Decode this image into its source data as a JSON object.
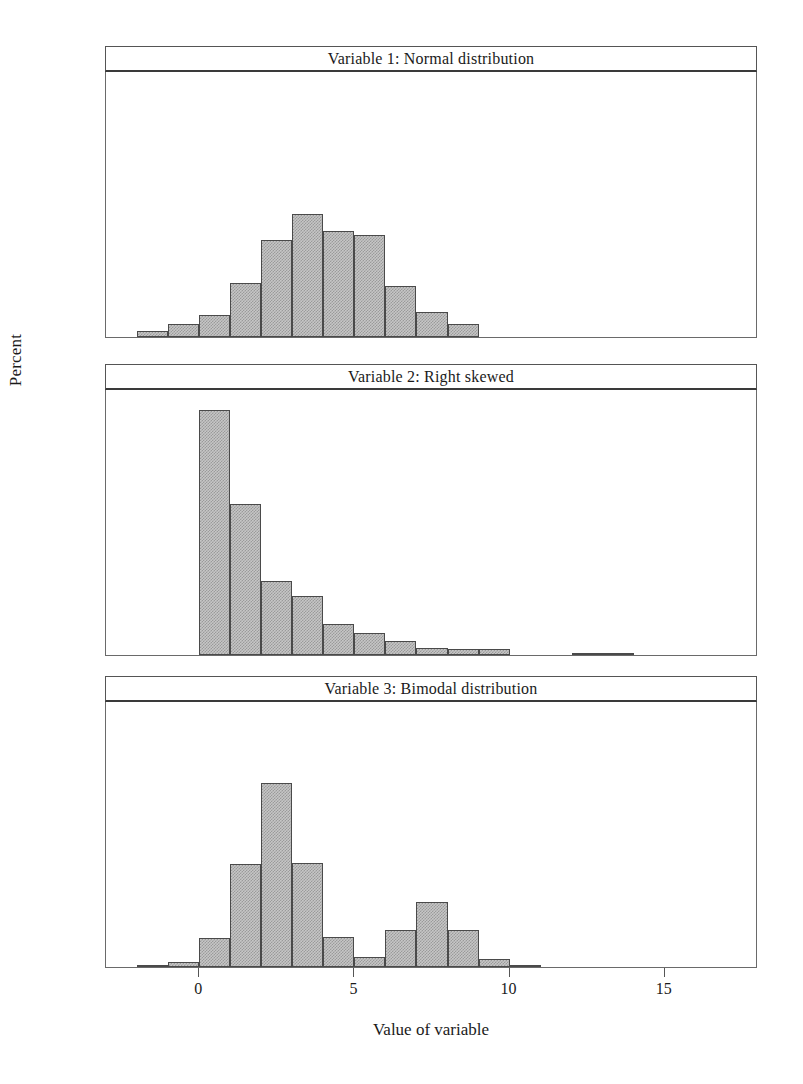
{
  "axes": {
    "ylabel": "Percent",
    "xlabel": "Value of variable",
    "yticks": [
      0,
      10,
      20,
      30,
      40
    ],
    "xticks": [
      0,
      5,
      10,
      15
    ],
    "ylim": [
      0,
      44
    ],
    "xlim": [
      -3,
      18
    ]
  },
  "colors": {
    "bar_fill": "#c6c6c6",
    "bar_edge": "#4a4a4a",
    "axis": "#6a6a6a",
    "text": "#1a1a1a"
  },
  "chart_data": [
    {
      "type": "bar",
      "title": "Variable 1: Normal distribution",
      "xlabel": "Value of variable",
      "ylabel": "Percent",
      "xlim": [
        -3,
        18
      ],
      "ylim": [
        0,
        44
      ],
      "bin_width": 1,
      "bin_starts": [
        -2,
        -1,
        0,
        1,
        2,
        3,
        4,
        5,
        6,
        7,
        8
      ],
      "values": [
        1.0,
        2.2,
        3.6,
        9.0,
        16.1,
        20.3,
        17.6,
        16.9,
        8.5,
        4.1,
        2.1,
        0.9
      ],
      "grid": false,
      "legend": false
    },
    {
      "type": "bar",
      "title": "Variable 2: Right skewed",
      "xlabel": "Value of variable",
      "ylabel": "Percent",
      "xlim": [
        -3,
        18
      ],
      "ylim": [
        0,
        44
      ],
      "bin_width": 1,
      "bin_starts": [
        0,
        1,
        2,
        3,
        4,
        5,
        6,
        7,
        8,
        9,
        12,
        13
      ],
      "values": [
        40.6,
        24.9,
        12.2,
        9.8,
        5.2,
        3.6,
        2.3,
        1.1,
        1.0,
        1.0,
        0.35,
        0.3
      ],
      "grid": false,
      "legend": false
    },
    {
      "type": "bar",
      "title": "Variable 3: Bimodal distribution",
      "xlabel": "Value of variable",
      "ylabel": "Percent",
      "xlim": [
        -3,
        18
      ],
      "ylim": [
        0,
        44
      ],
      "bin_width": 1,
      "bin_starts": [
        -2,
        -1,
        0,
        1,
        2,
        3,
        4,
        5,
        6,
        7,
        8,
        9,
        10
      ],
      "values": [
        0.3,
        0.8,
        4.8,
        17.1,
        30.4,
        17.2,
        5.0,
        1.7,
        6.2,
        10.7,
        6.2,
        1.4,
        0.4
      ],
      "grid": false,
      "legend": false
    }
  ]
}
